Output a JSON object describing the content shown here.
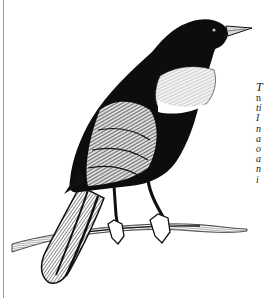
{
  "illustration": {
    "subject": "blackbird perched on branch",
    "style": "engraving",
    "colors": {
      "ink": "#111111",
      "paper": "#ffffff",
      "shoulder_patch": "#e6e6e6",
      "rule": "#9a9a9a"
    }
  },
  "text_column": {
    "lines": [
      {
        "text": "T"
      },
      {
        "text": "n"
      },
      {
        "text": "ti"
      },
      {
        "text": "I"
      },
      {
        "text": "n"
      },
      {
        "text": "a"
      },
      {
        "text": "o"
      },
      {
        "text": "a"
      },
      {
        "text": "n"
      },
      {
        "text": "i"
      }
    ]
  }
}
